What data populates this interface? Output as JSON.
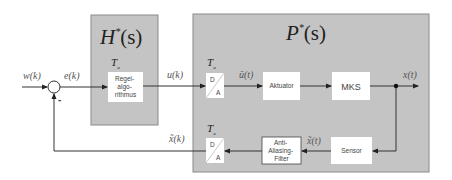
{
  "blocks": {
    "controller_group": {
      "title": "H*(s)",
      "title_main": "H",
      "title_sup": "*",
      "title_arg": "(s)"
    },
    "plant_group": {
      "title": "P*(s)",
      "title_main": "P",
      "title_sup": "*",
      "title_arg": "(s)"
    },
    "regelalgorithmus": {
      "lines": [
        "Regel-",
        "algo-",
        "rithmus"
      ],
      "sample_label": "T",
      "sample_sub": "a"
    },
    "da_converter_top": {
      "top": "D",
      "bottom": "A",
      "sample_label": "T",
      "sample_sub": "a"
    },
    "aktuator": {
      "label": "Aktuator"
    },
    "mks": {
      "label": "MKS"
    },
    "sensor": {
      "label": "Sensor"
    },
    "anti_aliasing_filter": {
      "lines": [
        "Anti-",
        "Aliasing-",
        "Filter"
      ]
    },
    "da_converter_bottom": {
      "top": "D",
      "bottom": "A",
      "sample_label": "T",
      "sample_sub": "a"
    }
  },
  "signals": {
    "w": "w(k)",
    "e": "e(k)",
    "u": "u(k)",
    "u_bar": "ū(t)",
    "x": "x(t)",
    "x_tilde_t": "x̃(t)",
    "x_tilde_k": "x̃(k)"
  },
  "summing_junction": {
    "sign": "-"
  },
  "colors": {
    "group_fill": "#c4c4c4",
    "group_border": "#8a8a8a",
    "block_fill": "#ffffff",
    "line": "#333333"
  }
}
